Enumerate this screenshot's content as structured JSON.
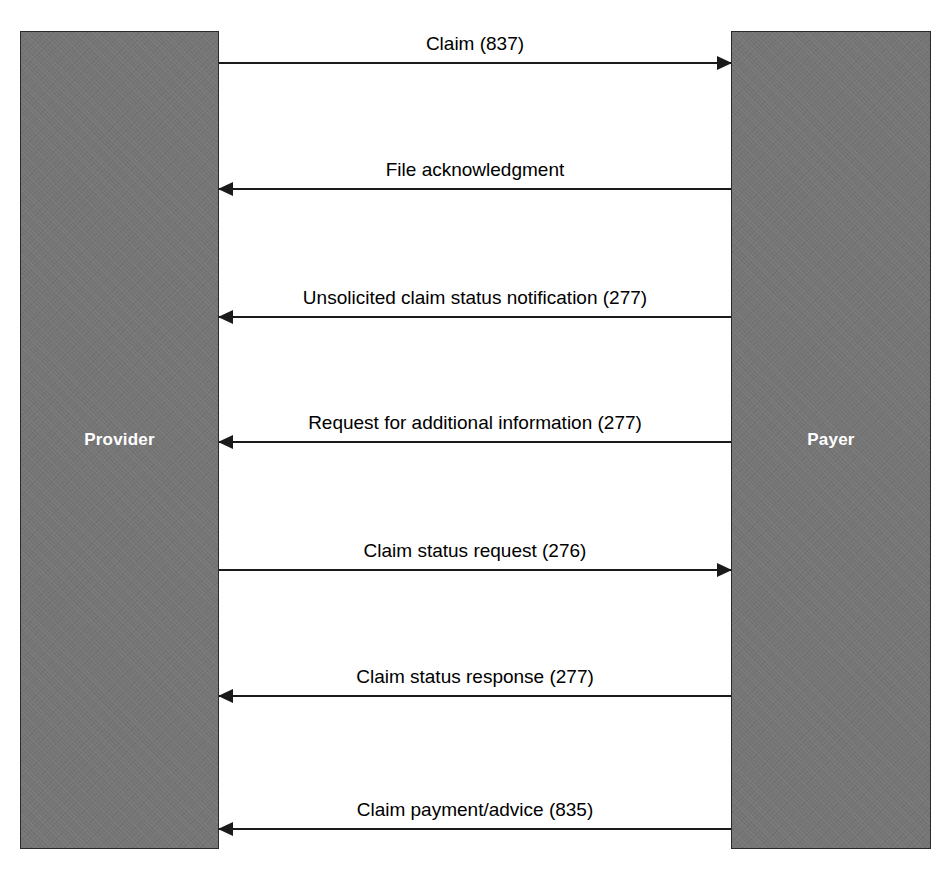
{
  "diagram": {
    "type": "sequence-diagram",
    "background_color": "#ffffff",
    "line_color": "#1a1a1a",
    "lifeline_fill": "#757575",
    "lifeline_border": "#2b2b2b",
    "lifeline_label_color": "#ffffff"
  },
  "lifelines": [
    {
      "id": "provider",
      "label": "Provider",
      "side": "left"
    },
    {
      "id": "payer",
      "label": "Payer",
      "side": "right"
    }
  ],
  "messages": [
    {
      "index": 1,
      "label": "Claim (837)",
      "direction": "right",
      "from": "Provider",
      "to": "Payer",
      "transaction_code": "837",
      "y": 62
    },
    {
      "index": 2,
      "label": "File acknowledgment",
      "direction": "left",
      "from": "Payer",
      "to": "Provider",
      "transaction_code": "",
      "y": 188
    },
    {
      "index": 3,
      "label": "Unsolicited claim status notification (277)",
      "direction": "left",
      "from": "Payer",
      "to": "Provider",
      "transaction_code": "277",
      "y": 316
    },
    {
      "index": 4,
      "label": "Request for additional information (277)",
      "direction": "left",
      "from": "Payer",
      "to": "Provider",
      "transaction_code": "277",
      "y": 441
    },
    {
      "index": 5,
      "label": "Claim status request (276)",
      "direction": "right",
      "from": "Provider",
      "to": "Payer",
      "transaction_code": "276",
      "y": 569
    },
    {
      "index": 6,
      "label": "Claim status response (277)",
      "direction": "left",
      "from": "Payer",
      "to": "Provider",
      "transaction_code": "277",
      "y": 695
    },
    {
      "index": 7,
      "label": "Claim payment/advice (835)",
      "direction": "left",
      "from": "Payer",
      "to": "Provider",
      "transaction_code": "835",
      "y": 828
    }
  ]
}
